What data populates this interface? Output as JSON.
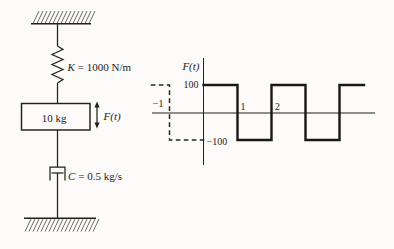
{
  "figure": {
    "background": "#fcfbf9",
    "ink": "#242119"
  },
  "diagram": {
    "spring": {
      "symbol": "K",
      "value": "= 1000 N/m"
    },
    "mass_label": "10 kg",
    "force_symbol": "F(t)",
    "damper": {
      "symbol": "C",
      "value": "= 0.5 kg/s"
    }
  },
  "graph": {
    "ylabel": "F(t)",
    "ytick_top": "100",
    "ytick_bottom": "−100",
    "xtick_minus1": "−1",
    "xtick_1": "1",
    "xtick_2": "2"
  },
  "chart_data": {
    "type": "line",
    "subtype": "square_wave",
    "title": "",
    "xlabel": "",
    "ylabel": "F(t)",
    "amplitude": 100,
    "period": 2,
    "high_value": 100,
    "low_value": -100,
    "yticks": [
      100,
      -100
    ],
    "xticks": [
      -1,
      1,
      2
    ],
    "xlim": [
      -1.55,
      5.05
    ],
    "ylim": [
      -200,
      200
    ],
    "grid": false,
    "solid_points": [
      [
        0,
        100
      ],
      [
        1,
        100
      ],
      [
        1,
        -100
      ],
      [
        2,
        -100
      ],
      [
        2,
        100
      ],
      [
        3,
        100
      ],
      [
        3,
        -100
      ],
      [
        4,
        -100
      ],
      [
        4,
        100
      ],
      [
        4.72,
        100
      ]
    ],
    "dashed_points": [
      [
        -1.55,
        100
      ],
      [
        -1,
        100
      ],
      [
        -1,
        -100
      ],
      [
        0.05,
        -100
      ]
    ],
    "note": "F(t) = +100 on (0,1),(2,3),(4,…); −100 on (1,2),(3,4); dashed segment shows periodic continuation for t < 0"
  }
}
